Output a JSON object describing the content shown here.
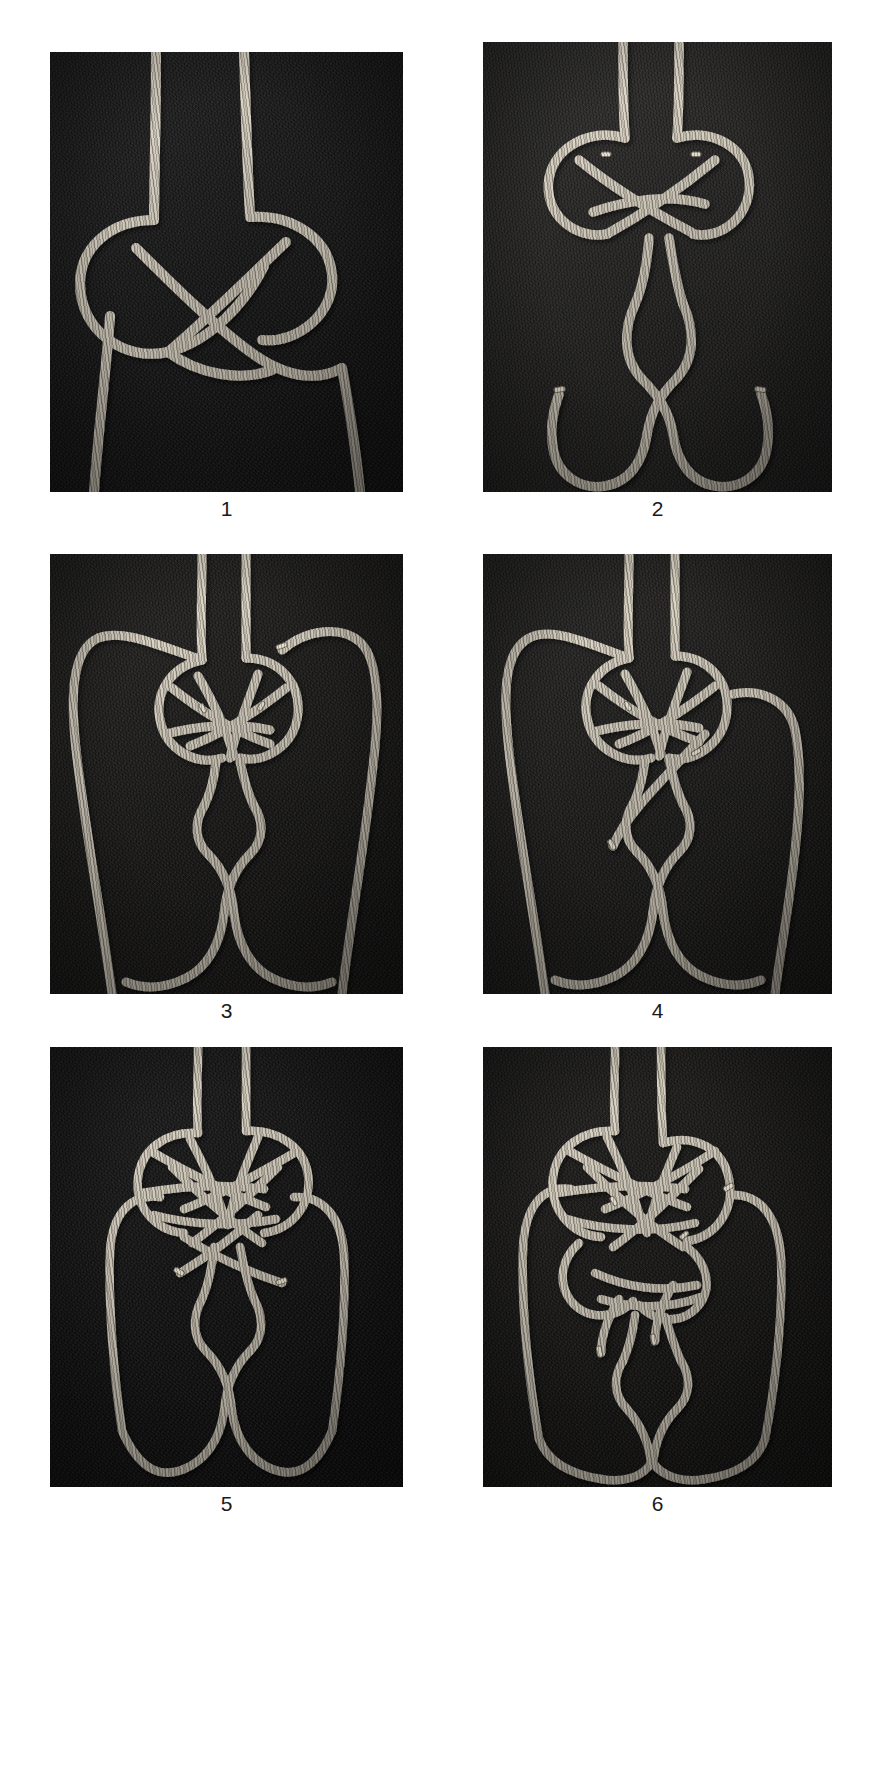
{
  "plate": {
    "background_color": "#ffffff",
    "caption_color": "#1a1a1a",
    "rope_color": "#d9d2c2",
    "rope_shadow_color": "#4a4640",
    "columns": 2,
    "rows": 3,
    "panel_count": 6
  },
  "panels": [
    {
      "id": "panel-1",
      "caption": "1",
      "background_color": "#191919",
      "subject": "two rope ends forming an interlaced overhand crossing knot",
      "position": {
        "x": 50,
        "y": 52,
        "width": 353,
        "height": 440
      }
    },
    {
      "id": "panel-2",
      "caption": "2",
      "background_color": "#272625",
      "subject": "knot tightened at top with two bights hanging below and cut ends at sides",
      "position": {
        "x": 483,
        "y": 42,
        "width": 349,
        "height": 450
      }
    },
    {
      "id": "panel-3",
      "caption": "3",
      "background_color": "#1d1c1b",
      "subject": "knot with two long side loops drawn out and a crossed bight beneath",
      "position": {
        "x": 50,
        "y": 554,
        "width": 353,
        "height": 440
      }
    },
    {
      "id": "panel-4",
      "caption": "4",
      "background_color": "#201f1e",
      "subject": "same arrangement as 3 with one working end tucked through the centre",
      "position": {
        "x": 483,
        "y": 554,
        "width": 349,
        "height": 440
      }
    },
    {
      "id": "panel-5",
      "caption": "5",
      "background_color": "#151414",
      "subject": "more tightly woven interlaced knot with two side loops and lower crossing",
      "position": {
        "x": 50,
        "y": 1047,
        "width": 353,
        "height": 440
      }
    },
    {
      "id": "panel-6",
      "caption": "6",
      "background_color": "#1a1918",
      "subject": "finished dense plaited knot with additional tucks and free ends",
      "position": {
        "x": 483,
        "y": 1047,
        "width": 349,
        "height": 440
      }
    }
  ],
  "footer": {
    "mark": ""
  }
}
